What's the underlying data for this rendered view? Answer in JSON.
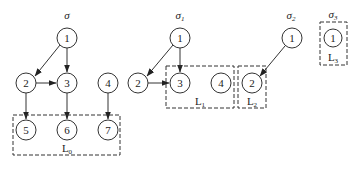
{
  "graphs": [
    {
      "title": {
        "base": "σ",
        "sub": ""
      },
      "nodes": [
        "1",
        "2",
        "3",
        "4",
        "5",
        "6",
        "7"
      ],
      "edges": [
        [
          "1",
          "2"
        ],
        [
          "1",
          "3"
        ],
        [
          "2",
          "3"
        ],
        [
          "2",
          "5"
        ],
        [
          "3",
          "6"
        ],
        [
          "4",
          "7"
        ]
      ],
      "boxes": [
        {
          "label": "L",
          "sub": "0",
          "contains": [
            "5",
            "6",
            "7"
          ]
        }
      ]
    },
    {
      "title": {
        "base": "σ",
        "sub": "1"
      },
      "nodes": [
        "1",
        "2",
        "3",
        "4"
      ],
      "edges": [
        [
          "1",
          "2"
        ],
        [
          "1",
          "3"
        ],
        [
          "2",
          "3"
        ]
      ],
      "boxes": [
        {
          "label": "L",
          "sub": "1",
          "contains": [
            "3",
            "4"
          ]
        }
      ]
    },
    {
      "title": {
        "base": "σ",
        "sub": "2"
      },
      "nodes": [
        "1",
        "2"
      ],
      "edges": [
        [
          "1",
          "2"
        ]
      ],
      "boxes": [
        {
          "label": "L",
          "sub": "2",
          "contains": [
            "2"
          ]
        }
      ]
    },
    {
      "title": {
        "base": "σ",
        "sub": "3"
      },
      "nodes": [
        "1"
      ],
      "edges": [],
      "boxes": [
        {
          "label": "L",
          "sub": "3",
          "contains": [
            "1"
          ]
        }
      ]
    }
  ],
  "colors": {
    "stroke": "#333333",
    "background": "#ffffff"
  }
}
